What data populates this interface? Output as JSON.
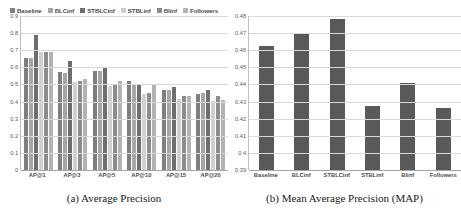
{
  "figure": {
    "panels": [
      {
        "id": "panel-a",
        "caption": "(a) Average Precision"
      },
      {
        "id": "panel-b",
        "caption": "(b) Mean Average Precision (MAP)"
      }
    ]
  },
  "series_colors": {
    "Baseline": "#7f7f7f",
    "BLCinf": "#a6a6a6",
    "STBLCinf": "#6e6e6e",
    "STBLinf": "#d0d0d0",
    "Blinf": "#8c8c8c",
    "Followers": "#b3b3b3",
    "map_bar": "#595959"
  },
  "chart_data": [
    {
      "type": "bar",
      "title": "",
      "subtitle": "",
      "xlabel": "",
      "ylabel": "",
      "caption": "(a) Average Precision",
      "grid": true,
      "legend_position": "top",
      "ylim": [
        0,
        0.9
      ],
      "yticks": [
        "0",
        "0.1",
        "0.2",
        "0.3",
        "0.4",
        "0.5",
        "0.6",
        "0.7",
        "0.8",
        "0.9"
      ],
      "ytick_values": [
        0,
        0.1,
        0.2,
        0.3,
        0.4,
        0.5,
        0.6,
        0.7,
        0.8,
        0.9
      ],
      "categories": [
        "AP@1",
        "AP@3",
        "AP@5",
        "AP@10",
        "AP@15",
        "AP@20"
      ],
      "series": [
        {
          "name": "Baseline",
          "values": [
            0.655,
            0.575,
            0.58,
            0.52,
            0.47,
            0.445
          ]
        },
        {
          "name": "BLCinf",
          "values": [
            0.655,
            0.565,
            0.58,
            0.505,
            0.47,
            0.45
          ]
        },
        {
          "name": "STBLCinf",
          "values": [
            0.79,
            0.635,
            0.595,
            0.5,
            0.485,
            0.465
          ]
        },
        {
          "name": "STBLinf",
          "values": [
            0.69,
            0.515,
            0.49,
            0.445,
            0.415,
            0.405
          ]
        },
        {
          "name": "Blinf",
          "values": [
            0.69,
            0.52,
            0.5,
            0.45,
            0.435,
            0.435
          ]
        },
        {
          "name": "Followers",
          "values": [
            0.69,
            0.53,
            0.52,
            0.495,
            0.435,
            0.41
          ]
        }
      ]
    },
    {
      "type": "bar",
      "title": "",
      "subtitle": "",
      "xlabel": "",
      "ylabel": "",
      "caption": "(b) Mean Average Precision (MAP)",
      "grid": true,
      "legend_position": "none",
      "ylim": [
        0.39,
        0.48
      ],
      "yticks": [
        "0.39",
        "0.4",
        "0.41",
        "0.42",
        "0.43",
        "0.44",
        "0.45",
        "0.46",
        "0.47",
        "0.48"
      ],
      "ytick_values": [
        0.39,
        0.4,
        0.41,
        0.42,
        0.43,
        0.44,
        0.45,
        0.46,
        0.47,
        0.48
      ],
      "categories": [
        "Baseline",
        "BLCinf",
        "STBLCinf",
        "STBLinf",
        "Blinf",
        "Followers"
      ],
      "values": [
        0.4625,
        0.47,
        0.478,
        0.4275,
        0.441,
        0.426
      ]
    }
  ],
  "legend": {
    "items": [
      {
        "label": "Baseline"
      },
      {
        "label": "BLCinf"
      },
      {
        "label": "STBLCinf"
      },
      {
        "label": "STBLinf"
      },
      {
        "label": "Blinf"
      },
      {
        "label": "Followers"
      }
    ]
  }
}
